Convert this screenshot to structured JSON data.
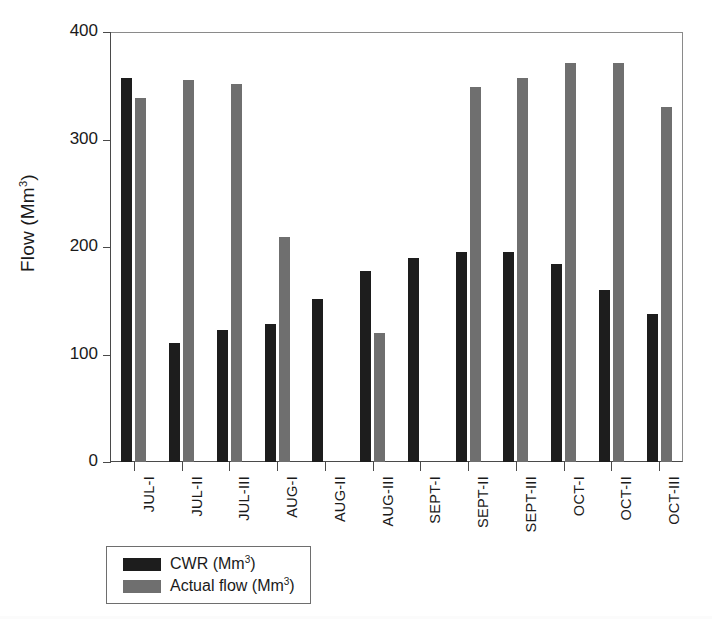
{
  "chart_data": {
    "type": "bar",
    "title": "",
    "xlabel": "",
    "ylabel": "Flow (Mm3)",
    "ylabel_base": "Flow (Mm",
    "ylabel_sup": "3",
    "ylabel_tail": ")",
    "ylim": [
      0,
      400
    ],
    "yticks": [
      0,
      100,
      200,
      300,
      400
    ],
    "ytick_labels": [
      "0",
      "100",
      "200",
      "300",
      "400"
    ],
    "grid": false,
    "legend_position": "below-axes-left",
    "categories": [
      "JUL-I",
      "JUL-II",
      "JUL-III",
      "AUG-I",
      "AUG-II",
      "AUG-III",
      "SEPT-I",
      "SEPT-II",
      "SEPT-III",
      "OCT-I",
      "OCT-II",
      "OCT-III"
    ],
    "series": [
      {
        "name": "CWR (Mm3)",
        "label_base": "CWR (Mm",
        "label_sup": "3",
        "label_tail": ")",
        "color": "#1d1d1d",
        "values": [
          357,
          111,
          123,
          128,
          152,
          178,
          190,
          195,
          195,
          184,
          160,
          138
        ]
      },
      {
        "name": "Actual flow (Mm3)",
        "label_base": "Actual flow (Mm",
        "label_sup": "3",
        "label_tail": ")",
        "color": "#6f6f6f",
        "values": [
          339,
          355,
          352,
          209,
          null,
          120,
          null,
          349,
          357,
          371,
          371,
          330
        ]
      }
    ]
  },
  "colors": {
    "cwr": "#1d1d1d",
    "actual": "#6f6f6f",
    "axis": "#4a4a4a",
    "frame": "#8a8a8a",
    "background": "#ffffff",
    "text": "#1a1a1a"
  }
}
